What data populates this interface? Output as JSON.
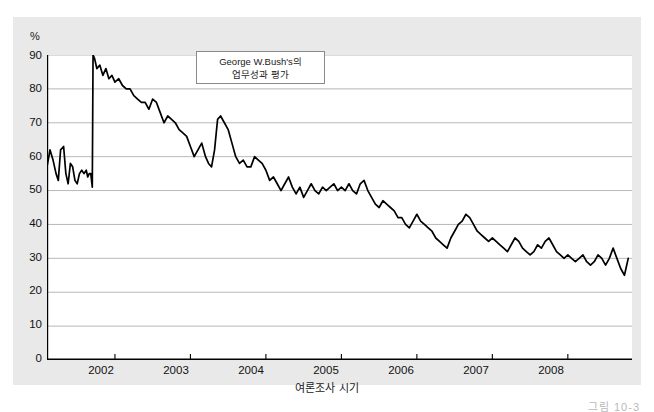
{
  "figure": {
    "background_color": "#e9e9e9",
    "plot_background_color": "#ffffff",
    "line_color": "#000000",
    "grid_color": "#b0b0b0",
    "axis_color": "#000000",
    "caption": "그림   10-3"
  },
  "annotation": {
    "line1": "George W.Bush's의",
    "line2": "업무성과 평가"
  },
  "axes": {
    "y_unit": "%",
    "x_title": "여론조사 시기",
    "y_ticks": [
      "90",
      "80",
      "70",
      "60",
      "50",
      "40",
      "30",
      "20",
      "10",
      "0"
    ],
    "x_ticks": [
      "2002",
      "2003",
      "2004",
      "2005",
      "2006",
      "2007",
      "2008"
    ]
  },
  "chart_data": {
    "type": "line",
    "title": "George W.Bush's의 업무성과 평가",
    "xlabel": "여론조사 시기",
    "ylabel": "%",
    "ylim": [
      0,
      90
    ],
    "xlim": [
      2001.1,
      2008.85
    ],
    "grid": true,
    "legend_position": "none",
    "yticks": [
      0,
      10,
      20,
      30,
      40,
      50,
      60,
      70,
      80,
      90
    ],
    "xticks": [
      2002,
      2003,
      2004,
      2005,
      2006,
      2007,
      2008
    ],
    "series": [
      {
        "name": "대통령 직무수행 지지율",
        "x": [
          2001.1,
          2001.14,
          2001.18,
          2001.22,
          2001.25,
          2001.28,
          2001.32,
          2001.35,
          2001.38,
          2001.41,
          2001.44,
          2001.47,
          2001.5,
          2001.53,
          2001.56,
          2001.59,
          2001.62,
          2001.64,
          2001.66,
          2001.68,
          2001.7,
          2001.71,
          2001.73,
          2001.76,
          2001.8,
          2001.84,
          2001.88,
          2001.92,
          2001.96,
          2002.0,
          2002.05,
          2002.1,
          2002.15,
          2002.2,
          2002.25,
          2002.3,
          2002.35,
          2002.4,
          2002.45,
          2002.5,
          2002.55,
          2002.6,
          2002.65,
          2002.7,
          2002.75,
          2002.8,
          2002.85,
          2002.9,
          2002.95,
          2003.0,
          2003.05,
          2003.1,
          2003.15,
          2003.2,
          2003.24,
          2003.28,
          2003.32,
          2003.36,
          2003.4,
          2003.45,
          2003.5,
          2003.55,
          2003.6,
          2003.65,
          2003.7,
          2003.75,
          2003.8,
          2003.85,
          2003.9,
          2003.95,
          2004.0,
          2004.05,
          2004.1,
          2004.15,
          2004.2,
          2004.25,
          2004.3,
          2004.35,
          2004.4,
          2004.45,
          2004.5,
          2004.55,
          2004.6,
          2004.65,
          2004.7,
          2004.75,
          2004.8,
          2004.85,
          2004.9,
          2004.95,
          2005.0,
          2005.05,
          2005.1,
          2005.15,
          2005.2,
          2005.25,
          2005.3,
          2005.35,
          2005.4,
          2005.45,
          2005.5,
          2005.55,
          2005.6,
          2005.65,
          2005.7,
          2005.75,
          2005.8,
          2005.85,
          2005.9,
          2005.95,
          2006.0,
          2006.05,
          2006.1,
          2006.15,
          2006.2,
          2006.25,
          2006.3,
          2006.35,
          2006.4,
          2006.45,
          2006.5,
          2006.55,
          2006.6,
          2006.65,
          2006.7,
          2006.75,
          2006.8,
          2006.85,
          2006.9,
          2006.95,
          2007.0,
          2007.05,
          2007.1,
          2007.15,
          2007.2,
          2007.25,
          2007.3,
          2007.35,
          2007.4,
          2007.45,
          2007.5,
          2007.55,
          2007.6,
          2007.65,
          2007.7,
          2007.75,
          2007.8,
          2007.85,
          2007.9,
          2007.95,
          2008.0,
          2008.05,
          2008.1,
          2008.15,
          2008.2,
          2008.25,
          2008.3,
          2008.35,
          2008.4,
          2008.45,
          2008.5,
          2008.55,
          2008.6,
          2008.65,
          2008.7,
          2008.75,
          2008.8
        ],
        "values": [
          57,
          62,
          59,
          55,
          53,
          62,
          63,
          55,
          52,
          58,
          57,
          53,
          52,
          55,
          56,
          55,
          56,
          54,
          55,
          55,
          51,
          90,
          89,
          86,
          87,
          84,
          86,
          83,
          84,
          82,
          83,
          81,
          80,
          80,
          78,
          77,
          76,
          76,
          74,
          77,
          76,
          73,
          70,
          72,
          71,
          70,
          68,
          67,
          66,
          63,
          60,
          62,
          64,
          60,
          58,
          57,
          62,
          71,
          72,
          70,
          68,
          64,
          60,
          58,
          59,
          57,
          57,
          60,
          59,
          58,
          56,
          53,
          54,
          52,
          50,
          52,
          54,
          51,
          49,
          51,
          48,
          50,
          52,
          50,
          49,
          51,
          50,
          51,
          52,
          50,
          51,
          50,
          52,
          50,
          49,
          52,
          53,
          50,
          48,
          46,
          45,
          47,
          46,
          45,
          44,
          42,
          42,
          40,
          39,
          41,
          43,
          41,
          40,
          39,
          38,
          36,
          35,
          34,
          33,
          36,
          38,
          40,
          41,
          43,
          42,
          40,
          38,
          37,
          36,
          35,
          36,
          35,
          34,
          33,
          32,
          34,
          36,
          35,
          33,
          32,
          31,
          32,
          34,
          33,
          35,
          36,
          34,
          32,
          31,
          30,
          31,
          30,
          29,
          30,
          31,
          29,
          28,
          29,
          31,
          30,
          28,
          30,
          33,
          30,
          27,
          25,
          30
        ]
      }
    ],
    "annotations": [
      {
        "text": "George W.Bush's의 업무성과 평가",
        "x": 2002.3,
        "y": 88
      }
    ]
  }
}
